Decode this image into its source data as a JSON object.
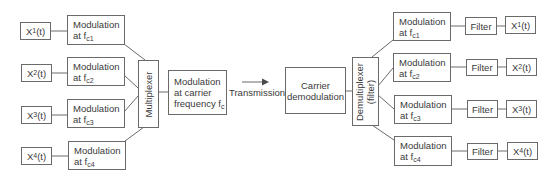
{
  "diagram": {
    "type": "block-diagram",
    "inputs": [
      {
        "name": "X",
        "sub": "1",
        "suffix": "(t)"
      },
      {
        "name": "X",
        "sub": "2",
        "suffix": "(t)"
      },
      {
        "name": "X",
        "sub": "3",
        "suffix": "(t)"
      },
      {
        "name": "X",
        "sub": "4",
        "suffix": "(t)"
      }
    ],
    "modulators": [
      {
        "line1": "Modulation",
        "line2": "at f",
        "sub": "c1"
      },
      {
        "line1": "Modulation",
        "line2": "at f",
        "sub": "c2"
      },
      {
        "line1": "Modulation",
        "line2": "at f",
        "sub": "c3"
      },
      {
        "line1": "Modulation",
        "line2": "at f",
        "sub": "c4"
      }
    ],
    "multiplexer": {
      "label": "Multiplexer"
    },
    "carrier_modulation": {
      "line1": "Modulation",
      "line2": "at carrier",
      "line3": "frequency f",
      "sub": "c"
    },
    "transmission": {
      "label": "Transmission"
    },
    "carrier_demodulation": {
      "line1": "Carrier",
      "line2": "demodulation"
    },
    "demultiplexer": {
      "line1": "Demultiplexer",
      "line2": "(filter)"
    },
    "demodulators": [
      {
        "line1": "Modulation",
        "line2": "at f",
        "sub": "c1"
      },
      {
        "line1": "Modulation",
        "line2": "at f",
        "sub": "c2"
      },
      {
        "line1": "Modulation",
        "line2": "at f",
        "sub": "c3"
      },
      {
        "line1": "Modulation",
        "line2": "at f",
        "sub": "c4"
      }
    ],
    "filters": [
      {
        "label": "Filter"
      },
      {
        "label": "Filter"
      },
      {
        "label": "Filter"
      },
      {
        "label": "Filter"
      }
    ],
    "outputs": [
      {
        "name": "X",
        "sub": "1",
        "suffix": "(t)"
      },
      {
        "name": "X",
        "sub": "2",
        "suffix": "(t)"
      },
      {
        "name": "X",
        "sub": "3",
        "suffix": "(t)"
      },
      {
        "name": "X",
        "sub": "4",
        "suffix": "(t)"
      }
    ],
    "colors": {
      "stroke": "#6a6a6a",
      "text": "#3a3a3a",
      "background": "#ffffff"
    }
  }
}
